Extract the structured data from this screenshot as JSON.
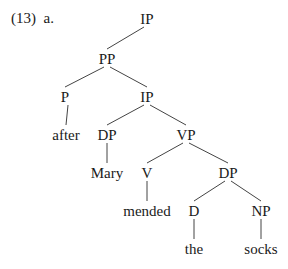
{
  "example": {
    "number": "(13)",
    "sub": "a."
  },
  "tree": {
    "nodes": [
      {
        "id": "ip1",
        "label": "IP",
        "x": 147,
        "y": 12
      },
      {
        "id": "pp",
        "label": "PP",
        "x": 107,
        "y": 52
      },
      {
        "id": "p",
        "label": "P",
        "x": 65,
        "y": 90
      },
      {
        "id": "ip2",
        "label": "IP",
        "x": 147,
        "y": 90
      },
      {
        "id": "after",
        "label": "after",
        "x": 66,
        "y": 128
      },
      {
        "id": "dp1",
        "label": "DP",
        "x": 107,
        "y": 128
      },
      {
        "id": "vp",
        "label": "VP",
        "x": 186,
        "y": 128
      },
      {
        "id": "mary",
        "label": "Mary",
        "x": 107,
        "y": 166
      },
      {
        "id": "v",
        "label": "V",
        "x": 147,
        "y": 166
      },
      {
        "id": "dp2",
        "label": "DP",
        "x": 228,
        "y": 166
      },
      {
        "id": "mended",
        "label": "mended",
        "x": 147,
        "y": 204
      },
      {
        "id": "d",
        "label": "D",
        "x": 194,
        "y": 204
      },
      {
        "id": "np",
        "label": "NP",
        "x": 261,
        "y": 204
      },
      {
        "id": "the",
        "label": "the",
        "x": 194,
        "y": 242
      },
      {
        "id": "socks",
        "label": "socks",
        "x": 261,
        "y": 242
      }
    ],
    "edges": [
      [
        "ip1",
        "pp"
      ],
      [
        "pp",
        "p"
      ],
      [
        "pp",
        "ip2"
      ],
      [
        "p",
        "after"
      ],
      [
        "ip2",
        "dp1"
      ],
      [
        "ip2",
        "vp"
      ],
      [
        "dp1",
        "mary"
      ],
      [
        "vp",
        "v"
      ],
      [
        "vp",
        "dp2"
      ],
      [
        "v",
        "mended"
      ],
      [
        "dp2",
        "d"
      ],
      [
        "dp2",
        "np"
      ],
      [
        "d",
        "the"
      ],
      [
        "np",
        "socks"
      ]
    ]
  }
}
